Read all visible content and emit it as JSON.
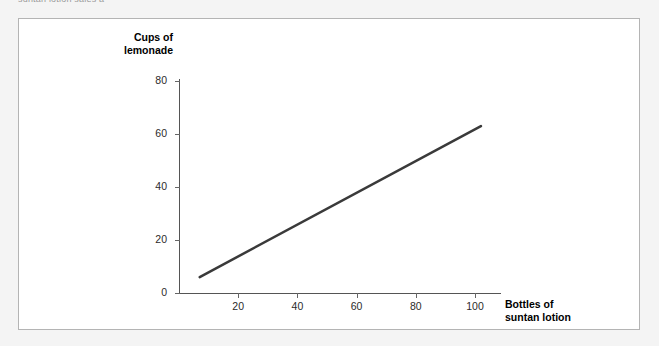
{
  "clipped_caption": "suntan lotion sales a",
  "chart_data": {
    "type": "line",
    "title": "",
    "xlabel": "Bottles of\nsuntan lotion",
    "ylabel": "Cups of\nlemonade",
    "xlim": [
      0,
      110
    ],
    "ylim": [
      0,
      88
    ],
    "grid": false,
    "legend": "none",
    "x_ticks": [
      "20",
      "40",
      "60",
      "80",
      "100"
    ],
    "x_tick_values": [
      20,
      40,
      60,
      80,
      100
    ],
    "y_ticks": [
      "0",
      "20",
      "40",
      "60",
      "80"
    ],
    "y_tick_values": [
      0,
      20,
      40,
      60,
      80
    ],
    "series": [
      {
        "name": "lemonade vs suntan lotion",
        "color": "#3a3a3a",
        "line_width": 2.5,
        "x": [
          7,
          102
        ],
        "values": [
          6,
          63
        ]
      }
    ]
  },
  "panel": {
    "border_color": "#b4b4b4",
    "background": "#ffffff"
  },
  "page": {
    "background": "#f4f4f4"
  }
}
